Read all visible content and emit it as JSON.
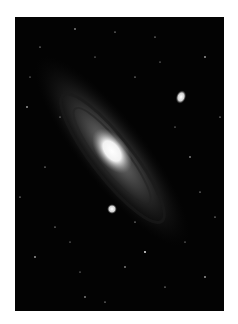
{
  "image": {
    "subject": "Andromeda galaxy",
    "background_color": "#030303",
    "page_color": "#ffffff"
  }
}
